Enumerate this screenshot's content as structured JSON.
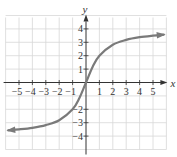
{
  "chart_data": {
    "type": "line",
    "title": "",
    "xlabel": "x",
    "ylabel": "y",
    "xlim": [
      -6,
      6
    ],
    "ylim": [
      -5,
      5
    ],
    "grid": true,
    "x_ticks": [
      -5,
      -4,
      -3,
      -2,
      -1,
      1,
      2,
      3,
      4,
      5
    ],
    "y_ticks": [
      -4,
      -3,
      -2,
      2,
      3,
      4,
      1
    ],
    "x_tick_labels": [
      "−5",
      "−4",
      "−3",
      "−2",
      "−1",
      "1",
      "2",
      "3",
      "4",
      "5"
    ],
    "y_tick_labels": [
      "−4",
      "−3",
      "−2",
      "2",
      "3",
      "4",
      "1"
    ],
    "series": [
      {
        "name": "f(x)",
        "description": "Increasing S-shaped curve through the origin with horizontal asymptotes near y = 4 and y = -4; arrows at both ends",
        "x": [
          -5.8,
          -5,
          -4,
          -3,
          -2,
          -1,
          -0.5,
          0,
          0.5,
          1,
          2,
          3,
          4,
          5,
          5.8
        ],
        "y": [
          -3.57,
          -3.5,
          -3.38,
          -3.18,
          -2.82,
          -2.0,
          -1.18,
          0,
          1.18,
          2.0,
          2.82,
          3.18,
          3.38,
          3.5,
          3.57
        ]
      }
    ],
    "colors": {
      "curve": "#7a7a7a",
      "axes": "#333333",
      "grid": "#d8d8d8"
    },
    "legend": null
  }
}
